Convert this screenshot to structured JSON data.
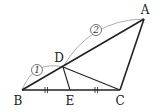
{
  "diagram": {
    "type": "geometry-triangle",
    "points": {
      "A": {
        "label": "A",
        "x": 144,
        "y": 19,
        "lx": 145,
        "ly": 14
      },
      "B": {
        "label": "B",
        "x": 22,
        "y": 90,
        "lx": 18,
        "ly": 105
      },
      "C": {
        "label": "C",
        "x": 120,
        "y": 90,
        "lx": 120,
        "ly": 105
      },
      "D": {
        "label": "D",
        "x": 63,
        "y": 67,
        "lx": 60,
        "ly": 62
      },
      "E": {
        "label": "E",
        "x": 70,
        "y": 90,
        "lx": 70,
        "ly": 105
      }
    },
    "segments": [
      "AB",
      "BC",
      "CA",
      "DE",
      "DC"
    ],
    "ratio_marks": [
      {
        "segment": "BD",
        "label": "1",
        "cx": 37,
        "cy": 70
      },
      {
        "segment": "DA",
        "label": "2",
        "cx": 96,
        "cy": 30
      }
    ],
    "equal_ticks": [
      {
        "segment": "BE",
        "x": 46,
        "y": 90
      },
      {
        "segment": "EC",
        "x": 96,
        "y": 90
      }
    ],
    "colors": {
      "line": "#222222",
      "arc": "#888888",
      "label": "#222222"
    }
  }
}
